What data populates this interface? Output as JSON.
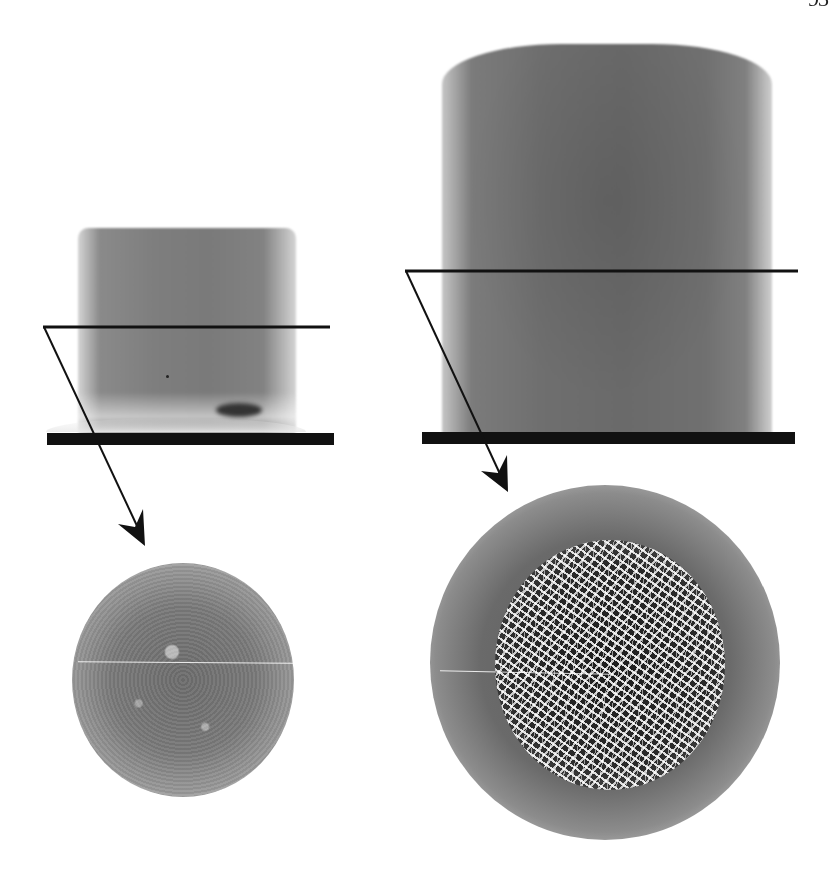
{
  "figure": {
    "type": "X-ray CT images of cylindrical specimens with cross-section slices",
    "panels": [
      {
        "id": "left",
        "description": "short cylindrical specimen on base plate with horizontal slice line; arrow to cross-section disc showing fine uniform texture",
        "slice_marker": "horizontal line",
        "cross_section": "fine-grained disc"
      },
      {
        "id": "right",
        "description": "tall cylindrical specimen on base plate with horizontal slice line; arrow to cross-section disc showing coarse network/porous core",
        "slice_marker": "horizontal line",
        "cross_section": "network-structured disc"
      }
    ],
    "colors": {
      "line": "#111111",
      "specimen_gray": "#707070",
      "background": "#ffffff"
    }
  },
  "page": {
    "number_fragment": "93"
  }
}
